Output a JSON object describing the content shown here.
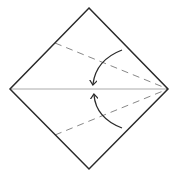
{
  "diagram": {
    "title": "Origami kite fold step",
    "colors": {
      "background": "#ffffff",
      "outline": "#2a2a2a",
      "center_crease": "#aaaaaa",
      "valley_fold": "#888888",
      "arrow": "#2a2a2a"
    },
    "square": {
      "top": [
        89,
        8
      ],
      "right": [
        168,
        89
      ],
      "bottom": [
        89,
        169
      ],
      "left": [
        10,
        89
      ]
    },
    "center_crease": {
      "from": [
        10,
        89
      ],
      "to": [
        168,
        89
      ]
    },
    "fold_lines": [
      {
        "name": "upper-valley-fold",
        "from": [
          55,
          43
        ],
        "to": [
          168,
          89
        ]
      },
      {
        "name": "lower-valley-fold",
        "from": [
          55,
          135
        ],
        "to": [
          168,
          89
        ]
      }
    ],
    "arrows": [
      {
        "name": "upper-fold-arrow",
        "start": [
          122,
          50
        ],
        "control": [
          96,
          60
        ],
        "end": [
          93,
          84
        ]
      },
      {
        "name": "lower-fold-arrow",
        "start": [
          122,
          128
        ],
        "control": [
          96,
          118
        ],
        "end": [
          94,
          95
        ]
      }
    ]
  }
}
